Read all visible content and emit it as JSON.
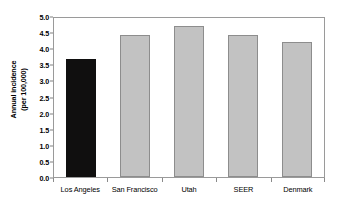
{
  "chart_data": {
    "type": "bar",
    "title": "",
    "subtitle": "",
    "xlabel": "",
    "ylabel": "Annual incidence (per 100,000)",
    "ylabel_lines": [
      "Annual incidence",
      "(per 100,000)"
    ],
    "categories": [
      "Los Angeles",
      "San Francisco",
      "Utah",
      "SEER",
      "Denmark"
    ],
    "values": [
      3.67,
      4.4,
      4.7,
      4.4,
      4.2
    ],
    "ylim": [
      0.0,
      5.0
    ],
    "ytick_labels": [
      "0.0",
      "0.5",
      "1.0",
      "1.5",
      "2.0",
      "2.5",
      "3.0",
      "3.5",
      "4.0",
      "4.5",
      "5.0"
    ],
    "ytick_values": [
      0.0,
      0.5,
      1.0,
      1.5,
      2.0,
      2.5,
      3.0,
      3.5,
      4.0,
      4.5,
      5.0
    ],
    "grid": false,
    "legend": null,
    "legend_position": "none",
    "bar_colors": [
      "#100f0f",
      "#c2c2c2",
      "#c2c2c2",
      "#c2c2c2",
      "#c2c2c2"
    ],
    "bar_border_color": "#8d8d8d",
    "highlight_index": 0,
    "frame_color": "#9a9a9a",
    "background": "#ffffff"
  }
}
